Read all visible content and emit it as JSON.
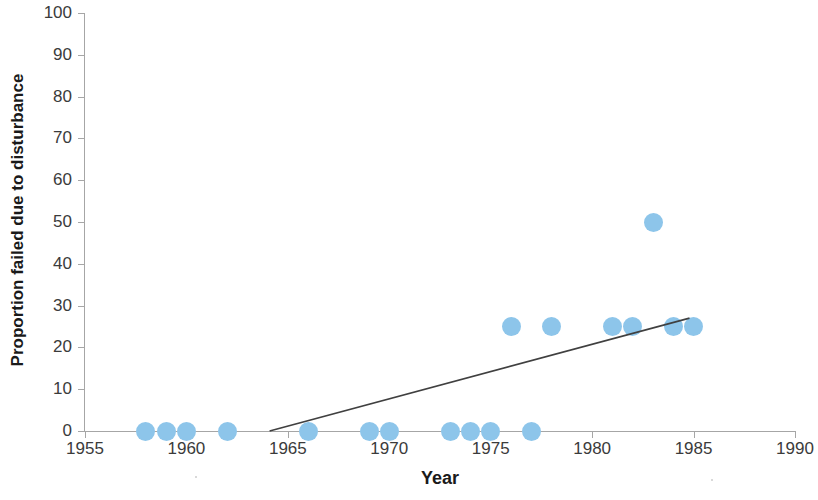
{
  "chart_data": {
    "type": "scatter",
    "title": "",
    "xlabel": "Year",
    "ylabel": "Proportion failed due to disturbance",
    "xlim": [
      1955,
      1990
    ],
    "ylim": [
      0,
      100
    ],
    "x_ticks": [
      1955,
      1960,
      1965,
      1970,
      1975,
      1980,
      1985,
      1990
    ],
    "y_ticks": [
      0,
      10,
      20,
      30,
      40,
      50,
      60,
      70,
      80,
      90,
      100
    ],
    "grid": false,
    "legend": false,
    "series": [
      {
        "name": "Proportion failed due to disturbance",
        "marker": "circle",
        "color": "#8dc5ea",
        "points": [
          {
            "x": 1958,
            "y": 0
          },
          {
            "x": 1959,
            "y": 0
          },
          {
            "x": 1960,
            "y": 0
          },
          {
            "x": 1962,
            "y": 0
          },
          {
            "x": 1966,
            "y": 0
          },
          {
            "x": 1969,
            "y": 0
          },
          {
            "x": 1970,
            "y": 0
          },
          {
            "x": 1973,
            "y": 0
          },
          {
            "x": 1974,
            "y": 0
          },
          {
            "x": 1975,
            "y": 0
          },
          {
            "x": 1977,
            "y": 0
          },
          {
            "x": 1976,
            "y": 25
          },
          {
            "x": 1978,
            "y": 25
          },
          {
            "x": 1981,
            "y": 25
          },
          {
            "x": 1982,
            "y": 25
          },
          {
            "x": 1983,
            "y": 50
          },
          {
            "x": 1984,
            "y": 25
          },
          {
            "x": 1985,
            "y": 25
          }
        ]
      }
    ],
    "trendline": {
      "name": "linear-trendline",
      "color": "#404040",
      "x_start": 1964.1,
      "y_start": 0,
      "x_end": 1984.8,
      "y_end": 27
    }
  },
  "axes": {
    "x_title": "Year",
    "y_title": "Proportion failed due to disturbance",
    "x_tick_labels": [
      "1955",
      "1960",
      "1965",
      "1970",
      "1975",
      "1980",
      "1985",
      "1990"
    ],
    "y_tick_labels": [
      "0",
      "10",
      "20",
      "30",
      "40",
      "50",
      "60",
      "70",
      "80",
      "90",
      "100"
    ]
  },
  "colors": {
    "marker": "#8dc5ea",
    "axis": "#a6a6a6",
    "trendline": "#404040",
    "text": "#3b3b3b",
    "title_text": "#1a1a1a",
    "background": "#ffffff"
  }
}
